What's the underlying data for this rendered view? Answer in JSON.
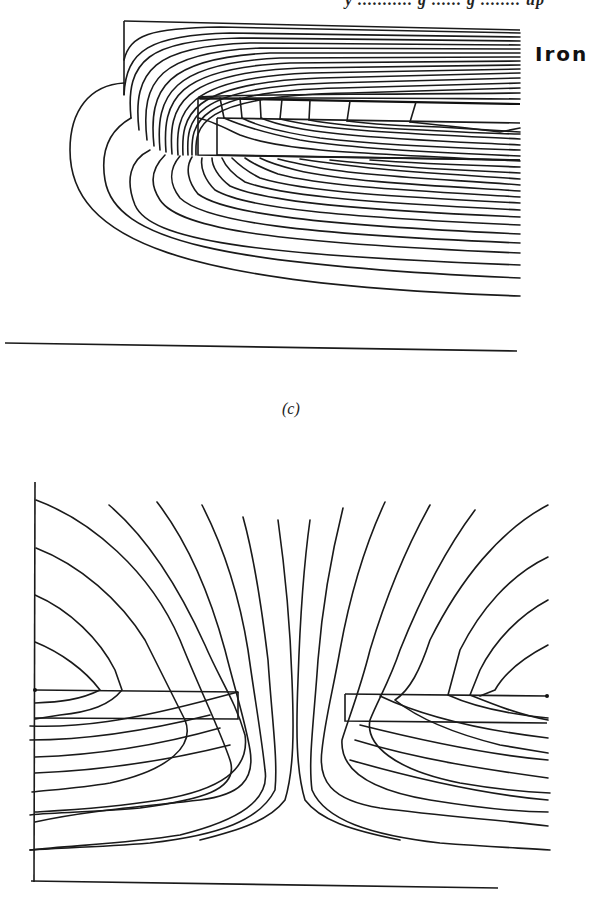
{
  "header": {
    "text": "y ........... g ...... g ........ up"
  },
  "figure_c": {
    "label": "Iron",
    "caption": "(c)",
    "description": "Flux plot of iron pole piece over a slot, flux lines wrapping from iron core into air region"
  },
  "figure_d": {
    "description": "Symmetric flux plot showing field lines between two facing conductor strips with fringing in the central gap"
  },
  "colors": {
    "line": "#1a1a1a",
    "background": "#ffffff"
  }
}
